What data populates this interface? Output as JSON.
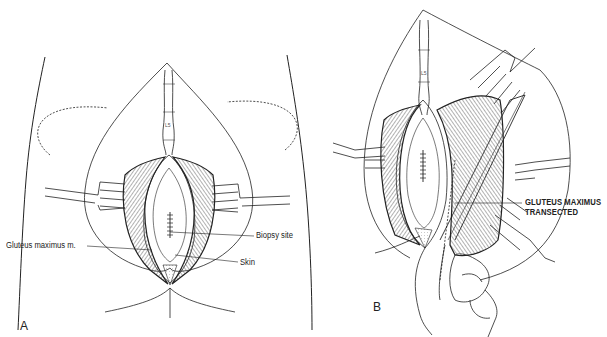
{
  "figure": {
    "panel_a": {
      "letter": "A",
      "vertebra_label": "L5",
      "labels": {
        "gluteus": "Gluteus maximus m.",
        "biopsy": "Biopsy site",
        "skin": "Skin"
      }
    },
    "panel_b": {
      "letter": "B",
      "vertebra_label": "L5",
      "labels": {
        "transected_line1": "GLUTEUS MAXIMUS",
        "transected_line2": "TRANSECTED"
      }
    },
    "colors": {
      "ink": "#222222",
      "hatch": "#555555",
      "background": "#ffffff"
    }
  }
}
